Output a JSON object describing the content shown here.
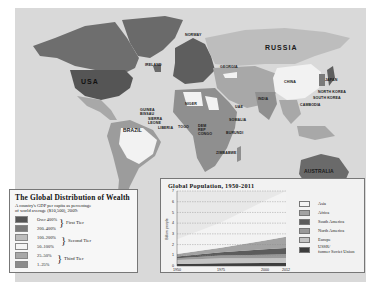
{
  "map": {
    "labels": {
      "usa": "USA",
      "russia": "RUSSIA",
      "brazil": "BRAZIL",
      "australia": "AUSTRALIA",
      "china": "CHINA",
      "norway": "NORWAY",
      "ireland": "IRELAND",
      "georgia": "GEORGIA",
      "japan": "JAPAN",
      "north_korea": "NORTH KOREA",
      "south_korea": "SOUTH KOREA",
      "cambodia": "CAMBODIA",
      "india": "INDIA",
      "uae": "UAE",
      "niger": "NIGER",
      "guinea_bissau": "GUINEA BISSAU",
      "sierra_leone": "SIERRA LEONE",
      "liberia": "LIBERIA",
      "togo": "TOGO",
      "dem_rep_congo": "DEM REP CONGO",
      "somalia": "SOMALIA",
      "burundi": "BURUNDI",
      "zimbabwe": "ZIMBABWE"
    },
    "colors": {
      "ocean": "#d9d9d9",
      "over_400": "#5e5e5e",
      "200_400": "#7a7a7a",
      "100_200": "#bdbdbd",
      "50_100": "#f2f2f2",
      "25_50": "#a6a6a6",
      "1_25": "#8f8f8f"
    }
  },
  "wealth_legend": {
    "title": "The Global Distribution of Wealth",
    "subtitle_line1": "A country's GDP per capita as percentage",
    "subtitle_line2": "of world average ($10,500), 2009:",
    "rows": [
      {
        "label": "Over 400%",
        "color": "#555555"
      },
      {
        "label": "200–400%",
        "color": "#7a7a7a"
      },
      {
        "label": "100–200%",
        "color": "#bdbdbd"
      },
      {
        "label": "50–100%",
        "color": "#f4f4f4"
      },
      {
        "label": "25–50%",
        "color": "#a8a8a8"
      },
      {
        "label": "1–25%",
        "color": "#8c8c8c"
      }
    ],
    "tiers": {
      "first": "First Tier",
      "second": "Second Tier",
      "third": "Third Tier"
    }
  },
  "chart_data": {
    "type": "area",
    "title": "Global Population, 1950-2011",
    "xlabel": "",
    "ylabel": "Billion people",
    "x": [
      1950,
      1975,
      2000,
      2012
    ],
    "x_tick_labels": [
      "1950",
      "1975",
      "2000",
      "2012"
    ],
    "y_ticks": [
      0,
      1,
      2,
      3,
      4,
      5,
      6,
      7
    ],
    "ylim": [
      0,
      7
    ],
    "grid": "horizontal dashed",
    "legend_position": "right",
    "stacking_order_bottom_to_top": [
      "USSR/former Soviet Union",
      "Europe",
      "North America",
      "South America",
      "Africa",
      "Asia"
    ],
    "series": [
      {
        "name": "USSR/former Soviet Union",
        "color": "#3d3d3d",
        "values": [
          0.18,
          0.25,
          0.29,
          0.29
        ]
      },
      {
        "name": "Europe",
        "color": "#c4c4c4",
        "values": [
          0.37,
          0.48,
          0.44,
          0.45
        ]
      },
      {
        "name": "North America",
        "color": "#9a9a9a",
        "values": [
          0.17,
          0.24,
          0.31,
          0.35
        ]
      },
      {
        "name": "South America",
        "color": "#5c5c5c",
        "values": [
          0.17,
          0.32,
          0.52,
          0.6
        ]
      },
      {
        "name": "Africa",
        "color": "#a3a3a3",
        "values": [
          0.23,
          0.42,
          0.81,
          1.05
        ]
      },
      {
        "name": "Asia",
        "color": "#f3f3f3",
        "values": [
          1.38,
          2.35,
          3.73,
          4.26
        ]
      }
    ],
    "totals": [
      2.5,
      4.06,
      6.1,
      7.0
    ]
  },
  "pop_legend": [
    {
      "label": "Asia",
      "color": "#f3f3f3"
    },
    {
      "label": "Africa",
      "color": "#a3a3a3"
    },
    {
      "label": "South America",
      "color": "#5c5c5c"
    },
    {
      "label": "North America",
      "color": "#9a9a9a"
    },
    {
      "label": "Europe",
      "color": "#c4c4c4"
    },
    {
      "label": "USSR/",
      "label2": "former Soviet Union",
      "color": "#3d3d3d"
    }
  ]
}
